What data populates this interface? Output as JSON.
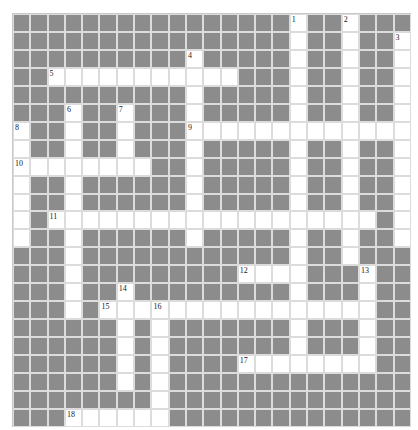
{
  "puzzle": {
    "rows": 23,
    "cols": 23,
    "colors": {
      "block": "#8c8c8c",
      "open": "#ffffff",
      "border": "#dcdcdc"
    },
    "open_cells": [
      [
        16,
        19
      ],
      [
        16,
        19,
        22
      ],
      [
        10,
        16,
        19,
        22
      ],
      [
        2,
        3,
        4,
        5,
        6,
        7,
        8,
        9,
        10,
        11,
        12,
        16,
        19,
        22
      ],
      [
        10,
        16,
        19,
        22
      ],
      [
        3,
        6,
        10,
        16,
        19,
        22
      ],
      [
        0,
        3,
        6,
        10,
        11,
        12,
        13,
        14,
        15,
        16,
        17,
        18,
        19,
        20,
        21,
        22
      ],
      [
        0,
        3,
        6,
        10,
        16,
        19,
        22
      ],
      [
        0,
        1,
        2,
        3,
        4,
        5,
        6,
        7,
        10,
        16,
        19,
        22
      ],
      [
        0,
        3,
        10,
        16,
        19,
        22
      ],
      [
        0,
        3,
        10,
        16,
        19,
        22
      ],
      [
        0,
        2,
        3,
        4,
        5,
        6,
        7,
        8,
        9,
        10,
        11,
        12,
        13,
        14,
        15,
        16,
        17,
        18,
        19,
        20,
        22
      ],
      [
        0,
        3,
        10,
        16,
        19,
        22
      ],
      [
        3,
        16,
        19
      ],
      [
        3,
        13,
        14,
        15,
        16,
        20
      ],
      [
        3,
        6,
        16,
        20
      ],
      [
        3,
        5,
        6,
        7,
        8,
        9,
        10,
        11,
        12,
        13,
        14,
        15,
        16,
        17,
        18,
        19,
        20
      ],
      [
        6,
        8,
        16,
        20
      ],
      [
        6,
        8,
        16,
        20
      ],
      [
        6,
        8,
        13,
        14,
        15,
        16,
        17,
        18,
        19,
        20
      ],
      [
        6,
        8
      ],
      [
        8
      ],
      [
        3,
        4,
        5,
        6,
        7,
        8
      ]
    ],
    "numbers": [
      {
        "n": "1",
        "row": 0,
        "col": 16
      },
      {
        "n": "2",
        "row": 0,
        "col": 19
      },
      {
        "n": "3",
        "row": 1,
        "col": 22
      },
      {
        "n": "4",
        "row": 2,
        "col": 10
      },
      {
        "n": "5",
        "row": 3,
        "col": 2
      },
      {
        "n": "6",
        "row": 5,
        "col": 3
      },
      {
        "n": "7",
        "row": 5,
        "col": 6
      },
      {
        "n": "8",
        "row": 6,
        "col": 0
      },
      {
        "n": "9",
        "row": 6,
        "col": 10
      },
      {
        "n": "10",
        "row": 8,
        "col": 0
      },
      {
        "n": "11",
        "row": 11,
        "col": 2
      },
      {
        "n": "12",
        "row": 14,
        "col": 13
      },
      {
        "n": "13",
        "row": 14,
        "col": 20
      },
      {
        "n": "14",
        "row": 15,
        "col": 6
      },
      {
        "n": "15",
        "row": 16,
        "col": 5
      },
      {
        "n": "16",
        "row": 16,
        "col": 8
      },
      {
        "n": "17",
        "row": 19,
        "col": 13
      },
      {
        "n": "18",
        "row": 22,
        "col": 3
      }
    ]
  }
}
